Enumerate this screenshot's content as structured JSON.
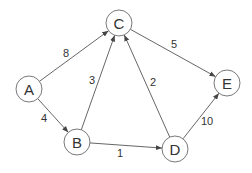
{
  "graph": {
    "type": "directed-weighted",
    "node_radius": 13,
    "nodes": [
      {
        "id": "A",
        "label": "A",
        "x": 29,
        "y": 89
      },
      {
        "id": "B",
        "label": "B",
        "x": 77,
        "y": 142
      },
      {
        "id": "C",
        "label": "C",
        "x": 119,
        "y": 23
      },
      {
        "id": "D",
        "label": "D",
        "x": 175,
        "y": 149
      },
      {
        "id": "E",
        "label": "E",
        "x": 227,
        "y": 83
      }
    ],
    "edges": [
      {
        "from": "A",
        "to": "C",
        "weight": "8",
        "lx": 66,
        "ly": 53
      },
      {
        "from": "A",
        "to": "B",
        "weight": "4",
        "lx": 44,
        "ly": 118
      },
      {
        "from": "B",
        "to": "C",
        "weight": "3",
        "lx": 92,
        "ly": 80
      },
      {
        "from": "B",
        "to": "D",
        "weight": "1",
        "lx": 120,
        "ly": 153
      },
      {
        "from": "D",
        "to": "C",
        "weight": "2",
        "lx": 153,
        "ly": 82
      },
      {
        "from": "C",
        "to": "E",
        "weight": "5",
        "lx": 174,
        "ly": 44
      },
      {
        "from": "D",
        "to": "E",
        "weight": "10",
        "lx": 207,
        "ly": 121
      }
    ]
  },
  "colors": {
    "stroke": "#6a6a6a",
    "edge": "#555555",
    "text": "#333333",
    "background": "#ffffff"
  }
}
